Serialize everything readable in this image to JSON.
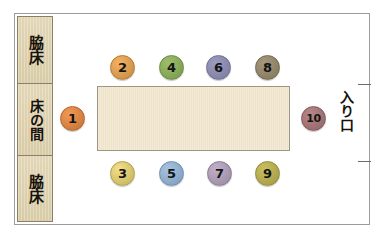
{
  "diagram": {
    "alcove": {
      "cells": [
        {
          "label": "脇床",
          "name": "waki-doko-upper"
        },
        {
          "label": "床の間",
          "name": "tokonoma"
        },
        {
          "label": "脇床",
          "name": "waki-doko-lower"
        }
      ]
    },
    "entrance": {
      "label": "入り口"
    },
    "table": {
      "fill": "#eee3c8",
      "border": "#9d9686"
    },
    "seats": [
      {
        "number": "1",
        "position": "head-left",
        "x": 60,
        "y": 106,
        "fill": "#f09a55",
        "border": "#b4632a"
      },
      {
        "number": "2",
        "position": "top-1",
        "x": 110,
        "y": 55,
        "fill": "#f5b264",
        "border": "#b27b33"
      },
      {
        "number": "3",
        "position": "bottom-1",
        "x": 110,
        "y": 161,
        "fill": "#f5e08a",
        "border": "#b0a04a"
      },
      {
        "number": "4",
        "position": "top-2",
        "x": 159,
        "y": 55,
        "fill": "#9dbf6c",
        "border": "#6b8a3e"
      },
      {
        "number": "5",
        "position": "bottom-2",
        "x": 159,
        "y": 161,
        "fill": "#a8c3e0",
        "border": "#6d8db0"
      },
      {
        "number": "6",
        "position": "top-3",
        "x": 206,
        "y": 55,
        "fill": "#9b9cc0",
        "border": "#6e6f92"
      },
      {
        "number": "7",
        "position": "bottom-3",
        "x": 207,
        "y": 161,
        "fill": "#c0b0c8",
        "border": "#8a7c94"
      },
      {
        "number": "8",
        "position": "top-4",
        "x": 255,
        "y": 55,
        "fill": "#a59a7e",
        "border": "#75694d"
      },
      {
        "number": "9",
        "position": "bottom-4",
        "x": 255,
        "y": 161,
        "fill": "#c9bf62",
        "border": "#948b36"
      },
      {
        "number": "10",
        "position": "head-right",
        "x": 301,
        "y": 106,
        "fill": "#b7878a",
        "border": "#86585b"
      }
    ]
  }
}
